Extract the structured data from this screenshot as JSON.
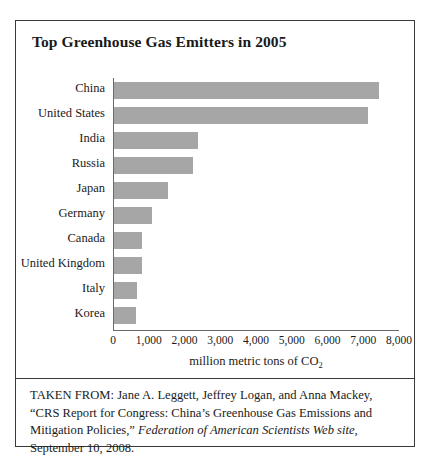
{
  "figure": {
    "title": "Top Greenhouse Gas Emitters in 2005",
    "caption": {
      "prefix": "TAKEN FROM: Jane A. Leggett, Jeffrey Logan, and Anna Mackey, “CRS Report for Congress: China’s Greenhouse Gas Emissions and Mitigation Policies,” ",
      "source_italic": "Federation of American Scientists Web site",
      "suffix": ", September 10, 2008."
    },
    "border_color": "#3a3a3a"
  },
  "chart_data": {
    "type": "bar",
    "orientation": "horizontal",
    "title": "Top Greenhouse Gas Emitters in 2005",
    "categories": [
      "China",
      "United States",
      "India",
      "Russia",
      "Japan",
      "Germany",
      "Canada",
      "United Kingdom",
      "Italy",
      "Korea"
    ],
    "values": [
      7400,
      7100,
      2350,
      2200,
      1500,
      1050,
      790,
      770,
      650,
      610
    ],
    "xlabel": "million metric tons of CO2",
    "xlabel_parts": {
      "text": "million metric tons of CO",
      "subscript": "2"
    },
    "ylabel": "",
    "xlim": [
      0,
      8000
    ],
    "xticks": [
      0,
      1000,
      2000,
      3000,
      4000,
      5000,
      6000,
      7000,
      8000
    ],
    "xticklabels": [
      "0",
      "1,000",
      "2,000",
      "3,000",
      "4,000",
      "5,000",
      "6,000",
      "7,000",
      "8,000"
    ],
    "grid": false,
    "legend": false,
    "bar_color": "#a6a6a6",
    "axis_color": "#6a6a6a"
  }
}
